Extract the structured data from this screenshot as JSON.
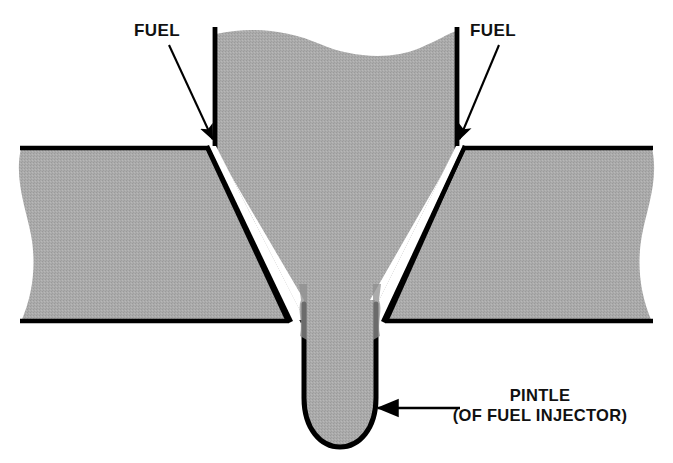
{
  "diagram": {
    "colors": {
      "metal_fill": "#a9a9a9",
      "outline": "#000000",
      "fuel_gap": "#ffffff",
      "background": "#ffffff",
      "text": "#111111"
    },
    "labels": {
      "fuel_left": "FUEL",
      "fuel_right": "FUEL",
      "pintle_line1": "PINTLE",
      "pintle_line2": "(OF FUEL INJECTOR)"
    },
    "callouts": [
      {
        "name": "fuel-left",
        "text": "FUEL",
        "text_x": 165,
        "text_y": 36,
        "leader_from_x": 168,
        "leader_from_y": 44,
        "leader_to_x": 213,
        "leader_to_y": 141,
        "arrow": "down-right"
      },
      {
        "name": "fuel-right",
        "text": "FUEL",
        "text_x": 503,
        "text_y": 36,
        "leader_from_x": 500,
        "leader_from_y": 44,
        "leader_to_x": 458,
        "leader_to_y": 141,
        "arrow": "down-left"
      },
      {
        "name": "pintle",
        "text": "PINTLE (OF FUEL INJECTOR)",
        "text_x": 575,
        "text_y": 412,
        "leader_from_x": 460,
        "leader_from_y": 408,
        "leader_to_x": 376,
        "leader_to_y": 408,
        "arrow": "left"
      }
    ],
    "parts": [
      {
        "name": "left-slab",
        "description": "sectioned engine wall, hatched gray, wavy break at left edge"
      },
      {
        "name": "right-slab",
        "description": "sectioned engine wall, hatched gray, wavy break at right edge"
      },
      {
        "name": "injector-body",
        "description": "central nozzle body tapering to a V, wavy break at top"
      },
      {
        "name": "fuel-annulus-left",
        "description": "white gap carrying fuel along left side of nozzle"
      },
      {
        "name": "fuel-annulus-right",
        "description": "white gap carrying fuel along right side of nozzle"
      },
      {
        "name": "pintle",
        "description": "rounded-tip pintle protruding below the nozzle"
      }
    ]
  }
}
